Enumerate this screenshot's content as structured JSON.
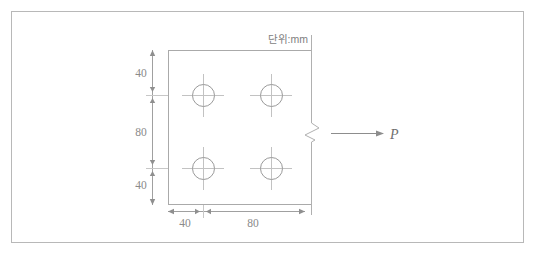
{
  "figure": {
    "unit_note": "단위:mm",
    "load_label": "P",
    "colors": {
      "frame_border": "#b8b8b8",
      "plate_outline": "#aaaaaa",
      "hole_outline": "#9a9a9a",
      "centerline": "#c2c2c2",
      "dimension_line": "#a0a0a0",
      "dimension_text": "#8a8a8a",
      "break_line": "#b0b0b0",
      "load_arrow": "#8d8d8d",
      "background": "#ffffff"
    },
    "vertical_dimensions": [
      {
        "label": "40",
        "value": 40
      },
      {
        "label": "80",
        "value": 80
      },
      {
        "label": "40",
        "value": 40
      }
    ],
    "horizontal_dimensions": [
      {
        "label": "40",
        "value": 40
      },
      {
        "label": "80",
        "value": 80
      }
    ],
    "bolt_holes": [
      {
        "name": "hole-top-left",
        "cx": 203,
        "cy": 95,
        "r": 11
      },
      {
        "name": "hole-top-right",
        "cx": 271,
        "cy": 95,
        "r": 11
      },
      {
        "name": "hole-bottom-left",
        "cx": 203,
        "cy": 168,
        "r": 11
      },
      {
        "name": "hole-bottom-right",
        "cx": 271,
        "cy": 168,
        "r": 11
      }
    ],
    "plate": {
      "x": 168,
      "y": 50,
      "width": 143,
      "height": 155
    }
  }
}
